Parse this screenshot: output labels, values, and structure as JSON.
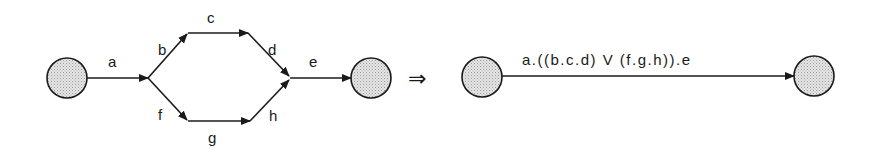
{
  "left_graph": {
    "edges": {
      "a": "a",
      "b": "b",
      "c": "c",
      "d": "d",
      "e": "e",
      "f": "f",
      "g": "g",
      "h": "h"
    }
  },
  "transform_symbol": "⇒",
  "right_graph": {
    "edge_label": "a.((b.c.d) V (f.g.h)).e"
  },
  "colors": {
    "stroke": "#1a1a1a",
    "node_fill": "#d9d9d9",
    "background": "#ffffff"
  }
}
